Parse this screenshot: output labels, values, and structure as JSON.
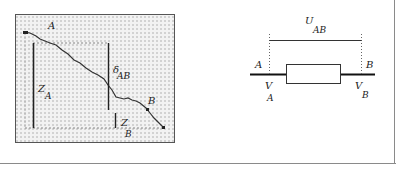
{
  "figure": {
    "left_panel": {
      "description": "Ground profile between two points A and B with heights and height difference",
      "labels": {
        "point_a": "A",
        "point_b": "B",
        "height_a_main": "Z",
        "height_a_sub": "A",
        "height_b_main": "Z",
        "height_b_sub": "B",
        "delta_main": "δ",
        "delta_sub": "AB"
      },
      "colors": {
        "panel_fill": "#ececec",
        "dots": "#9a9a9a",
        "lines": "#222222"
      }
    },
    "right_panel": {
      "description": "Resistor element between nodes A and B with potentials and voltage",
      "labels": {
        "node_a": "A",
        "node_b": "B",
        "voltage_main": "U",
        "voltage_sub": "AB",
        "potential_a_main": "V",
        "potential_a_sub": "A",
        "potential_b_main": "V",
        "potential_b_sub": "B"
      },
      "colors": {
        "wire": "#111111",
        "box": "#333333"
      }
    }
  }
}
